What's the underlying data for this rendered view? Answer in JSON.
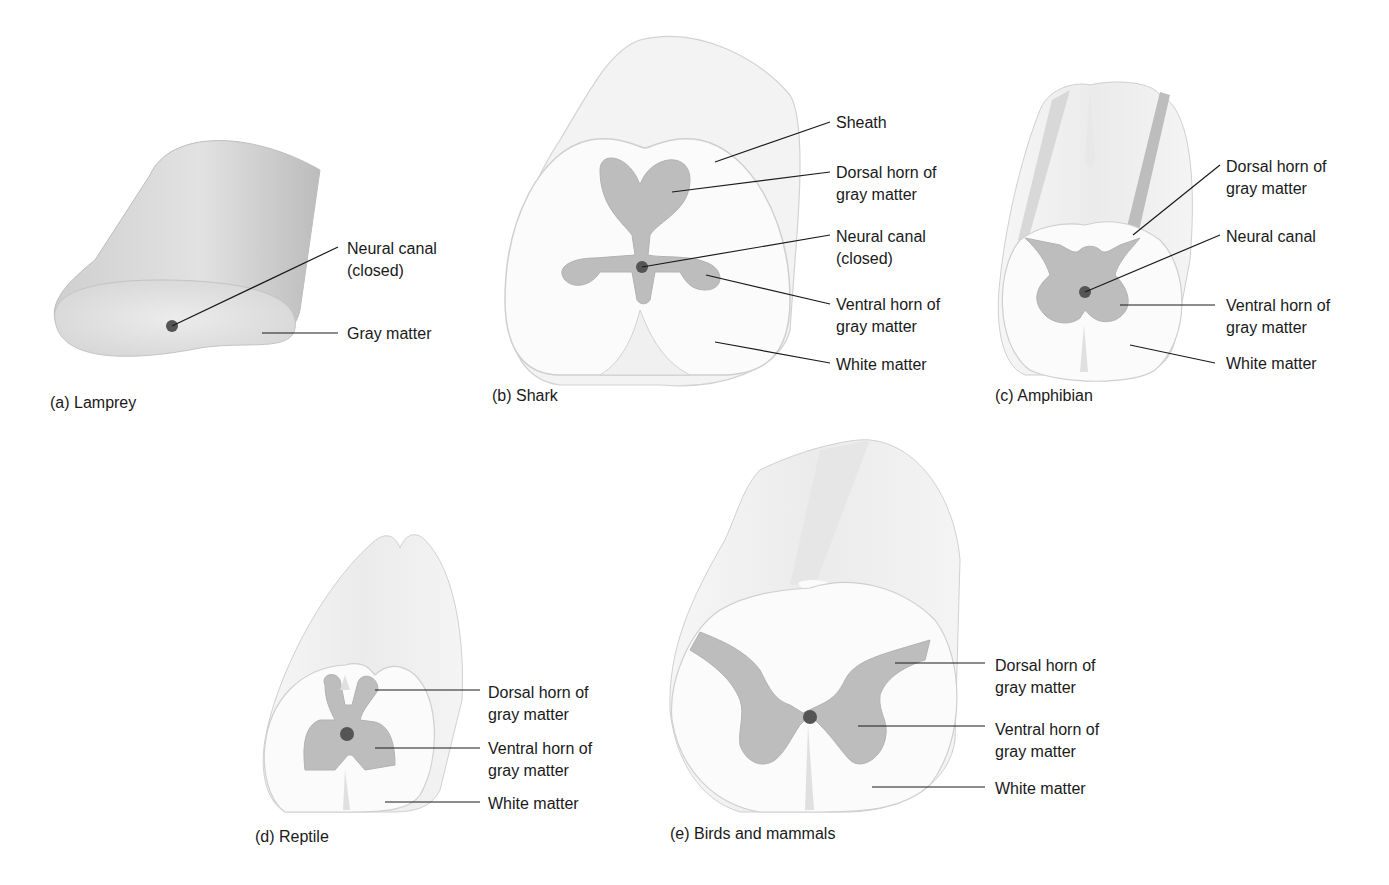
{
  "figure": {
    "panels": [
      {
        "id": "a",
        "caption": "(a) Lamprey",
        "labels": [
          {
            "text": "Neural canal\n(closed)"
          },
          {
            "text": "Gray matter"
          }
        ]
      },
      {
        "id": "b",
        "caption": "(b) Shark",
        "labels": [
          {
            "text": "Sheath"
          },
          {
            "text": "Dorsal horn of\ngray matter"
          },
          {
            "text": "Neural canal\n(closed)"
          },
          {
            "text": "Ventral horn of\ngray matter"
          },
          {
            "text": "White matter"
          }
        ]
      },
      {
        "id": "c",
        "caption": "(c) Amphibian",
        "labels": [
          {
            "text": "Dorsal horn of\ngray matter"
          },
          {
            "text": "Neural canal"
          },
          {
            "text": "Ventral horn of\ngray matter"
          },
          {
            "text": "White matter"
          }
        ]
      },
      {
        "id": "d",
        "caption": "(d) Reptile",
        "labels": [
          {
            "text": "Dorsal horn of\ngray matter"
          },
          {
            "text": "Ventral horn of\ngray matter"
          },
          {
            "text": "White matter"
          }
        ]
      },
      {
        "id": "e",
        "caption": "(e) Birds and mammals",
        "labels": [
          {
            "text": "Dorsal horn of\ngray matter"
          },
          {
            "text": "Ventral horn of\ngray matter"
          },
          {
            "text": "White matter"
          }
        ]
      }
    ],
    "colors": {
      "gray_matter": "#bdbdbd",
      "white_matter": "#fafafa",
      "outline": "#c8c8c8",
      "canal": "#555555",
      "leader": "#1a1a1a"
    }
  }
}
